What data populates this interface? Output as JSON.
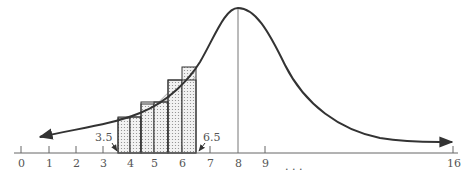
{
  "figure": {
    "axis": {
      "ticks": [
        "0",
        "1",
        "2",
        "3",
        "4",
        "5",
        "6",
        "7",
        "8",
        "9",
        "16"
      ],
      "ellipsis": ". . .",
      "annotations": {
        "left": "3.5",
        "right": "6.5"
      }
    },
    "curve": {
      "peak_x": 8,
      "range": [
        0,
        16
      ]
    },
    "bars": {
      "interval": [
        3.5,
        6.5
      ],
      "coarse_width": 1,
      "fine_width": 0.5
    },
    "colors": {
      "line": "#333333",
      "fill": "#dcdcdc",
      "axis": "#555555",
      "text": "#555555"
    }
  }
}
